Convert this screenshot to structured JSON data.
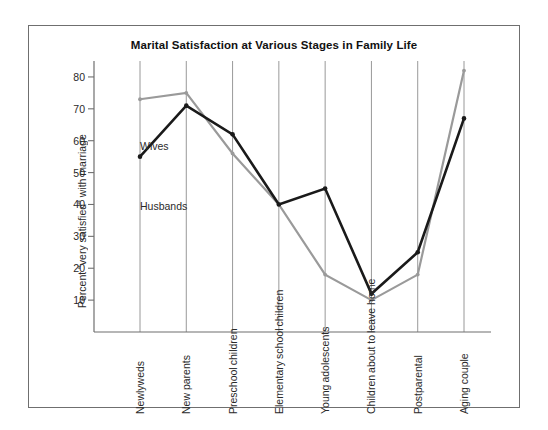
{
  "chart_data": {
    "type": "line",
    "title": "Marital Satisfaction at Various Stages in Family Life",
    "xlabel": "",
    "ylabel": "Percent \"very satisfied\" with marriage",
    "ylim": [
      0,
      85
    ],
    "yticks": [
      10,
      20,
      30,
      40,
      50,
      60,
      70,
      80
    ],
    "grid": "vertical-only",
    "legend_position": "inline-annotations",
    "categories": [
      "Newlyweds",
      "New parents",
      "Preschool children",
      "Elementary school children",
      "Young adolescents",
      "Children about to leave home",
      "Postparental",
      "Aging couple"
    ],
    "category_lines": [
      [
        "Newlyweds"
      ],
      [
        "New parents"
      ],
      [
        "Preschool",
        "children"
      ],
      [
        "Elementary",
        "school",
        "children"
      ],
      [
        "Young",
        "adolescents"
      ],
      [
        "Children",
        "about to",
        "leave home"
      ],
      [
        "Postparental"
      ],
      [
        "Aging couple"
      ]
    ],
    "series": [
      {
        "name": "Wives",
        "color": "#9a9a9a",
        "values": [
          73,
          75,
          56,
          40,
          18,
          10,
          18,
          82
        ]
      },
      {
        "name": "Husbands",
        "color": "#1a1a1a",
        "values": [
          55,
          71,
          62,
          40,
          45,
          12,
          25,
          67
        ]
      }
    ],
    "annotations": [
      {
        "text": "Wives"
      },
      {
        "text": "Husbands"
      }
    ]
  },
  "colors": {
    "frame": "#6f6f6f",
    "axis": "#6f6f6f",
    "gridline": "#8d8d8d",
    "wives_line": "#9a9a9a",
    "husbands_line": "#1a1a1a",
    "background": "#ffffff"
  }
}
